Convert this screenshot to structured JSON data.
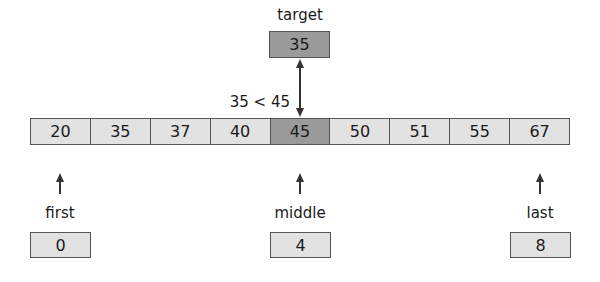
{
  "target": {
    "label": "target",
    "value": "35"
  },
  "comparison": "35 < 45",
  "array": {
    "values": [
      "20",
      "35",
      "37",
      "40",
      "45",
      "50",
      "51",
      "55",
      "67"
    ],
    "highlight_index": 4
  },
  "pointers": [
    {
      "label": "first",
      "value": "0"
    },
    {
      "label": "middle",
      "value": "4"
    },
    {
      "label": "last",
      "value": "8"
    }
  ],
  "colors": {
    "cell": "#e2e2e2",
    "highlight": "#9a9a9a",
    "border": "#555555",
    "arrow": "#333333"
  }
}
